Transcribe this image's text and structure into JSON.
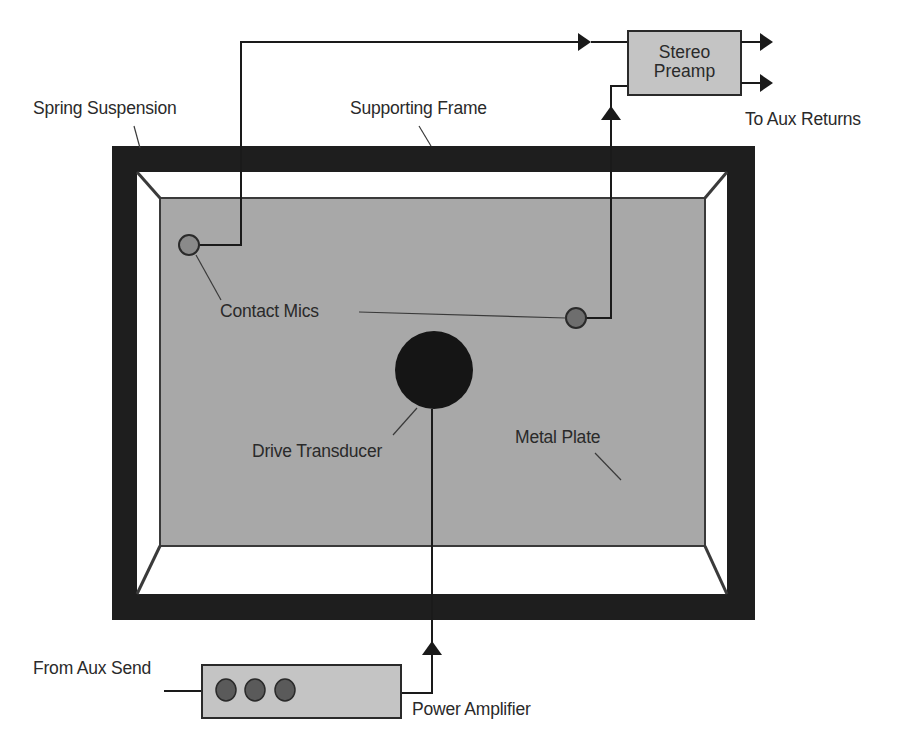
{
  "diagram": {
    "type": "plate-reverb-schematic",
    "colors": {
      "frame": "#1e1e1e",
      "plate": "#a8a8a8",
      "plate_border": "#3a3a3a",
      "mic": "#7a7a7a",
      "transducer": "#151515",
      "box_fill": "#c4c4c4",
      "amp_knob": "#5a5a5a",
      "wire": "#1a1a1a",
      "background": "#ffffff"
    },
    "components": {
      "frame": {
        "label": "Supporting Frame"
      },
      "suspension": {
        "label": "Spring Suspension"
      },
      "plate": {
        "label": "Metal Plate"
      },
      "mics": {
        "label": "Contact Mics",
        "count": 2
      },
      "transducer": {
        "label": "Drive Transducer"
      },
      "preamp": {
        "line1": "Stereo",
        "line2": "Preamp"
      },
      "amplifier": {
        "label": "Power Amplifier",
        "knob_count": 3
      }
    },
    "io": {
      "input": "From Aux Send",
      "output": "To Aux Returns"
    }
  }
}
